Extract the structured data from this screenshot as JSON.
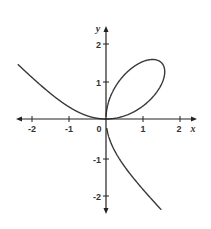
{
  "chart_data": {
    "type": "line",
    "title": "",
    "xlabel": "x",
    "ylabel": "y",
    "xlim": [
      -2.4,
      2.4
    ],
    "ylim": [
      -2.5,
      2.5
    ],
    "grid": false,
    "legend": null,
    "x_ticks": [
      -2,
      -1,
      0,
      1,
      2
    ],
    "x_tick_labels": [
      "-2",
      "-1",
      "0",
      "1",
      "2"
    ],
    "y_ticks": [
      -2,
      -1,
      1,
      2
    ],
    "y_tick_labels": [
      "-2",
      "-1",
      "1",
      "2"
    ],
    "curve_description": "Folium of Descartes x^3 + y^3 = 3xy: loop in first quadrant with tip near (1.5, 1.5), branch extending to upper-left and branch extending to lower-right",
    "series": [
      {
        "name": "left-branch",
        "points": [
          [
            -2.38,
            1.51
          ],
          [
            -2.0,
            1.16
          ],
          [
            -1.5,
            0.72
          ],
          [
            -1.0,
            0.37
          ],
          [
            -0.5,
            0.11
          ],
          [
            -0.25,
            0.03
          ],
          [
            0,
            0
          ]
        ]
      },
      {
        "name": "loop",
        "points": [
          [
            0,
            0
          ],
          [
            0.5,
            0.1
          ],
          [
            1.0,
            0.38
          ],
          [
            1.4,
            0.85
          ],
          [
            1.5,
            1.5
          ],
          [
            1.3,
            1.55
          ],
          [
            0.85,
            1.4
          ],
          [
            0.38,
            1.0
          ],
          [
            0.1,
            0.5
          ],
          [
            0,
            0
          ]
        ]
      },
      {
        "name": "lower-branch",
        "points": [
          [
            0,
            0
          ],
          [
            0.03,
            -0.25
          ],
          [
            0.11,
            -0.5
          ],
          [
            0.37,
            -1.0
          ],
          [
            0.72,
            -1.5
          ],
          [
            1.16,
            -2.0
          ],
          [
            1.51,
            -2.42
          ]
        ]
      }
    ]
  },
  "labels": {
    "x_axis": "x",
    "y_axis": "y",
    "origin": "0",
    "x_ticks": [
      "-2",
      "-1",
      "1",
      "2"
    ],
    "y_ticks": [
      "2",
      "1",
      "-1",
      "-2"
    ]
  },
  "colors": {
    "curve": "#3a3a3a",
    "axis": "#222222",
    "background": "#ffffff"
  }
}
